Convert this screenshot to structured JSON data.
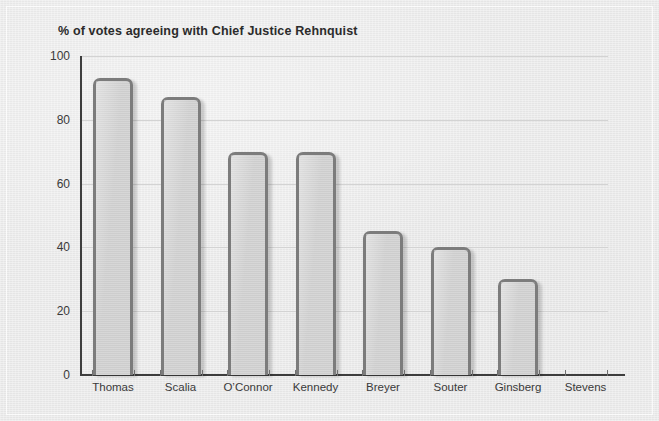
{
  "chart_data": {
    "type": "bar",
    "title": "% of votes agreeing with Chief Justice Rehnquist",
    "xlabel": "",
    "ylabel": "",
    "ylim": [
      0,
      100
    ],
    "yticks": [
      0,
      20,
      40,
      60,
      80,
      100
    ],
    "ytick_labels": [
      "0",
      "20",
      "40",
      "60",
      "80",
      "100"
    ],
    "grid": true,
    "legend": false,
    "categories": [
      "Thomas",
      "Scalia",
      "O’Connor",
      "Kennedy",
      "Breyer",
      "Souter",
      "Ginsberg",
      "Stevens"
    ],
    "values": [
      93,
      87,
      70,
      70,
      45,
      40,
      30,
      0
    ],
    "colors": {
      "background": "#ebebeb",
      "bar_fill": "#cfcfcf",
      "bar_border": "#7c7c7c",
      "axis": "#3d3d3d",
      "gridline": "#d3d3d3",
      "title_text": "#2b2b2b",
      "tick_text": "#3a3a3a"
    }
  }
}
